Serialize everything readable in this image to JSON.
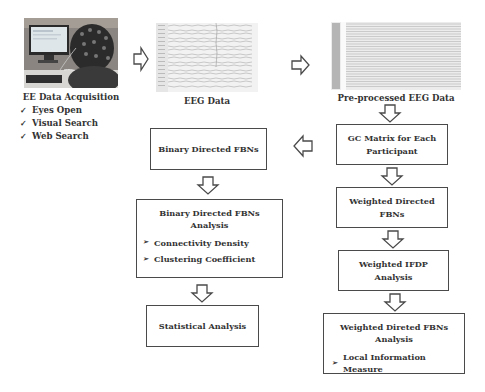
{
  "acquisition": {
    "caption": "EE Data Acquisition",
    "conditions": [
      "Eyes Open",
      "Visual Search",
      "Web Search"
    ],
    "check_glyph": "✓"
  },
  "eeg_raw": {
    "caption": "EEG Data"
  },
  "eeg_pre": {
    "caption": "Pre-processed EEG Data"
  },
  "boxes": {
    "gc_matrix": {
      "line1": "GC Matrix for Each",
      "line2": "Participant"
    },
    "binary_fbns": {
      "label": "Binary Directed FBNs"
    },
    "weighted_fbns": {
      "label": "Weighted Directed FBNs"
    },
    "binary_analysis": {
      "title": "Binary Directed FBNs Analysis",
      "items": [
        "Connectivity Density",
        "Clustering Coefficient"
      ]
    },
    "weighted_ifdp": {
      "label": "Weighted IFDP Analysis"
    },
    "weighted_analysis": {
      "title": "Weighted Direted FBNs Analysis",
      "items": [
        "Local Information Measure"
      ]
    },
    "statistical": {
      "label": "Statistical Analysis"
    }
  },
  "bullet_glyph": "➢",
  "colors": {
    "stroke": "#4a4a4a",
    "text": "#333333",
    "background": "#ffffff"
  }
}
